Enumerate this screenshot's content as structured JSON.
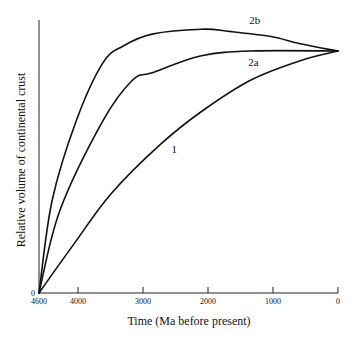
{
  "chart_data": {
    "type": "line",
    "title": "",
    "xlabel": "Time (Ma before present)",
    "ylabel": "Relative volume of continental crust",
    "xlim": [
      4600,
      0
    ],
    "ylim": [
      0,
      1.13
    ],
    "x_reversed": true,
    "grid": false,
    "x_ticks": [
      4600,
      4000,
      3000,
      2000,
      1000,
      0
    ],
    "x_tick_labels": [
      "4600",
      "4000",
      "3000",
      "2000",
      "1000",
      "0"
    ],
    "y_ticks": [
      0
    ],
    "y_tick_labels": [
      "0"
    ],
    "series": [
      {
        "name": "2b",
        "x": [
          4600,
          4400,
          4030,
          3620,
          3310,
          2860,
          2100,
          1640,
          1030,
          580,
          0
        ],
        "y": [
          0,
          0.38,
          0.71,
          0.95,
          1.02,
          1.07,
          1.09,
          1.08,
          1.06,
          1.03,
          1.0
        ],
        "label_pos": {
          "x": 1280,
          "y": 1.11
        }
      },
      {
        "name": "2a",
        "x": [
          4600,
          4280,
          3620,
          3160,
          2860,
          2100,
          1340,
          0
        ],
        "y": [
          0,
          0.34,
          0.71,
          0.88,
          0.91,
          0.98,
          1.0,
          1.0
        ],
        "label_pos": {
          "x": 1300,
          "y": 0.94
        }
      },
      {
        "name": "1",
        "x": [
          4600,
          4070,
          3490,
          2750,
          2100,
          1340,
          580,
          0
        ],
        "y": [
          0,
          0.2,
          0.41,
          0.61,
          0.75,
          0.88,
          0.96,
          1.0
        ],
        "label_pos": {
          "x": 2520,
          "y": 0.58
        }
      }
    ],
    "legend": "inline curve labels"
  },
  "axes": {
    "x_title": "Time (Ma before present)",
    "y_title": "Relative volume of continental crust",
    "y_zero_label": "0"
  }
}
